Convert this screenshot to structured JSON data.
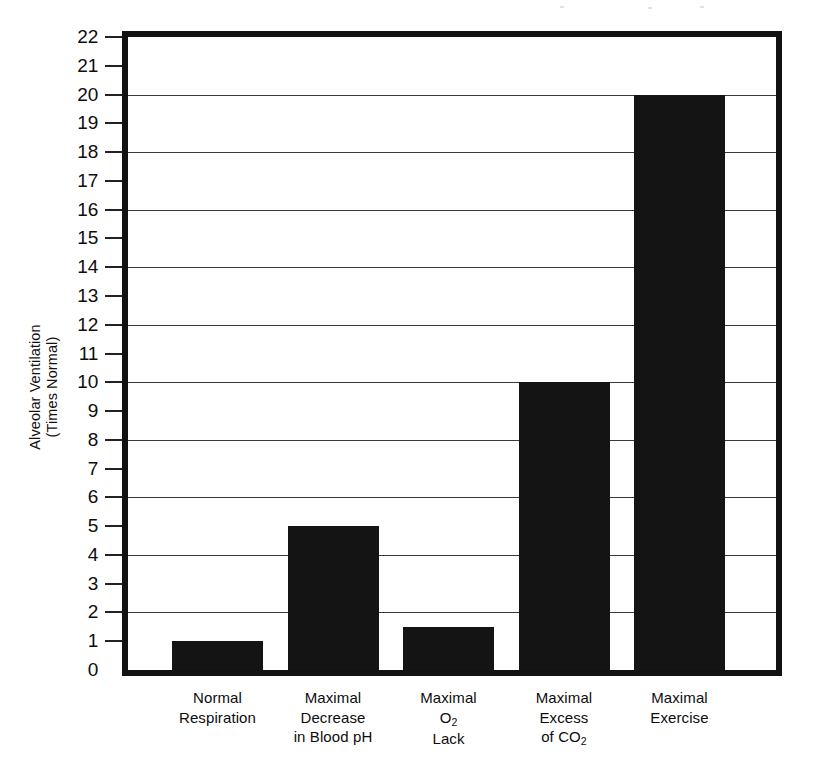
{
  "chart_data": {
    "type": "bar",
    "title": "",
    "subtitle": "",
    "xlabel": "",
    "ylabel": "Alveolar Ventilation\n(Times Normal)",
    "categories": [
      "Normal\nRespiration",
      "Maximal\nDecrease\nin Blood pH",
      "Maximal\nO2\nLack",
      "Maximal\nExcess\nof CO2",
      "Maximal\nExercise"
    ],
    "values": [
      1,
      5,
      1.5,
      10,
      20
    ],
    "ylim": [
      0,
      22
    ],
    "y_tick_labels": [
      "0",
      "1",
      "2",
      "3",
      "4",
      "5",
      "6",
      "7",
      "8",
      "9",
      "10",
      "11",
      "12",
      "13",
      "14",
      "15",
      "16",
      "17",
      "18",
      "19",
      "20",
      "21",
      "22"
    ],
    "gridline_values": [
      2,
      4,
      6,
      8,
      10,
      12,
      14,
      16,
      18,
      20
    ],
    "grid": true,
    "legend": "none",
    "bar_color": "#141414",
    "axis_color": "#121212",
    "background_color": "#ffffff"
  },
  "axis": {
    "y_title_line1": "Alveolar Ventilation",
    "y_title_line2": "(Times Normal)"
  },
  "categories_display": [
    {
      "lines": [
        "Normal",
        "Respiration"
      ]
    },
    {
      "lines": [
        "Maximal",
        "Decrease",
        "in Blood pH"
      ]
    },
    {
      "lines": [
        "Maximal",
        "O₂",
        "Lack"
      ]
    },
    {
      "lines": [
        "Maximal",
        "Excess",
        "of CO₂"
      ]
    },
    {
      "lines": [
        "Maximal",
        "Exercise"
      ]
    }
  ]
}
